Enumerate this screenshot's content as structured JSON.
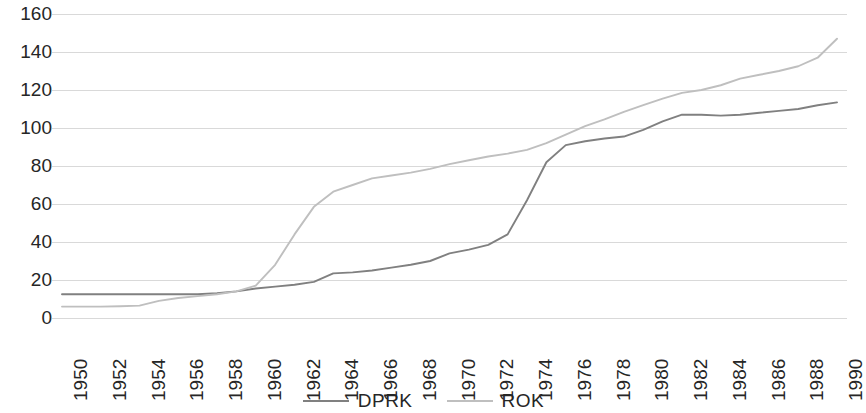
{
  "chart_data": {
    "type": "line",
    "title": "",
    "subtitle": "",
    "xlabel": "",
    "ylabel": "",
    "xlim": [
      1950,
      1990
    ],
    "ylim": [
      0,
      160
    ],
    "y_ticks": [
      0,
      20,
      40,
      60,
      80,
      100,
      120,
      140,
      160
    ],
    "x_ticks": [
      1950,
      1952,
      1954,
      1956,
      1958,
      1960,
      1962,
      1964,
      1966,
      1968,
      1970,
      1972,
      1974,
      1976,
      1978,
      1980,
      1982,
      1984,
      1986,
      1988,
      1990
    ],
    "x": [
      1950,
      1951,
      1952,
      1953,
      1954,
      1955,
      1956,
      1957,
      1958,
      1959,
      1960,
      1961,
      1962,
      1963,
      1964,
      1965,
      1966,
      1967,
      1968,
      1969,
      1970,
      1971,
      1972,
      1973,
      1974,
      1975,
      1976,
      1977,
      1978,
      1979,
      1980,
      1981,
      1982,
      1983,
      1984,
      1985,
      1986,
      1987,
      1988,
      1989,
      1990
    ],
    "grid": true,
    "grid_axis": "y",
    "legend_position": "bottom",
    "series": [
      {
        "name": "DPRK",
        "color": "#808080",
        "values": [
          12.5,
          12.5,
          12.5,
          12.5,
          12.5,
          12.5,
          12.5,
          12.5,
          13,
          14,
          15.5,
          16.5,
          17.5,
          19,
          23.5,
          24,
          25,
          26.5,
          28,
          30,
          34,
          36,
          38.5,
          44,
          62,
          82,
          91,
          93,
          94.5,
          95.5,
          99,
          103.5,
          107,
          107,
          106.5,
          107,
          108,
          109,
          110,
          112,
          113.5
        ]
      },
      {
        "name": "ROK",
        "color": "#bfbfbf",
        "values": [
          6,
          6,
          6,
          6.2,
          6.5,
          9,
          10.5,
          11.5,
          12.5,
          14,
          17,
          28,
          44,
          58.5,
          66.5,
          70,
          73.5,
          75,
          76.5,
          78.5,
          81,
          83,
          85,
          86.5,
          88.5,
          92,
          96.5,
          101,
          104.5,
          108.5,
          112,
          115.5,
          118.5,
          120,
          122.5,
          126,
          128,
          130,
          132.5,
          137,
          147
        ]
      }
    ]
  },
  "legend": {
    "items": [
      {
        "label": "DPRK",
        "color": "#808080"
      },
      {
        "label": "ROK",
        "color": "#bfbfbf"
      }
    ]
  },
  "axis_colors": {
    "grid": "#d9d9d9",
    "tick_text": "#262626"
  }
}
